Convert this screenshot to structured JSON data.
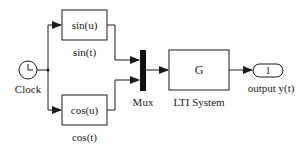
{
  "diagram": {
    "type": "simulink-block-diagram",
    "colors": {
      "line": "#1a1a1a",
      "background": "#ffffff",
      "mux": "#111111"
    },
    "blocks": {
      "clock": {
        "label": "Clock",
        "icon": "clock-icon"
      },
      "sin": {
        "content": "sin(u)",
        "label": "sin(t)"
      },
      "cos": {
        "content": "cos(u)",
        "label": "cos(t)"
      },
      "mux": {
        "label": "Mux"
      },
      "lti": {
        "content": "G",
        "label": "LTI System"
      },
      "output": {
        "content": "1",
        "label": "output y(t)"
      }
    },
    "connections": [
      {
        "from": "Clock",
        "to": "sin(u)"
      },
      {
        "from": "Clock",
        "to": "cos(u)"
      },
      {
        "from": "sin(u)",
        "to": "Mux",
        "port": 1
      },
      {
        "from": "cos(u)",
        "to": "Mux",
        "port": 2
      },
      {
        "from": "Mux",
        "to": "LTI System"
      },
      {
        "from": "LTI System",
        "to": "output y(t)"
      }
    ]
  }
}
